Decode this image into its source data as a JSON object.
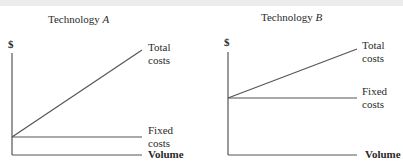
{
  "panels": [
    {
      "title": "Technology",
      "title_italic": "A",
      "y_label": "$",
      "x_label": "Volume",
      "total_label_1": "Total",
      "total_label_2": "costs",
      "fixed_label_1": "Fixed",
      "fixed_label_2": "costs"
    },
    {
      "title": "Technology",
      "title_italic": "B",
      "y_label": "$",
      "x_label": "Volume",
      "total_label_1": "Total",
      "total_label_2": "costs",
      "fixed_label_1": "Fixed",
      "fixed_label_2": "costs"
    }
  ],
  "colors": {
    "line": "#555555",
    "text": "#2a2a2a"
  }
}
